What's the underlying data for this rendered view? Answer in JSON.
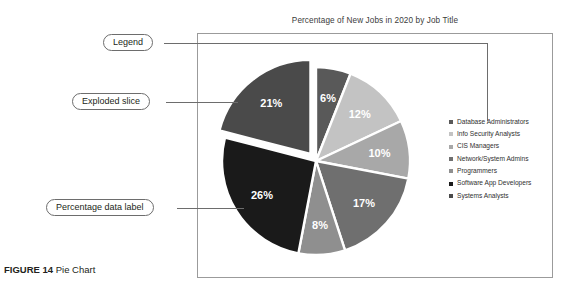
{
  "figure": {
    "caption_label": "FIGURE 14",
    "caption_text": "Pie Chart"
  },
  "callouts": {
    "legend": "Legend",
    "exploded": "Exploded slice",
    "data_label": "Percentage data label"
  },
  "chart_data": {
    "type": "pie",
    "title": "Percentage of New Jobs in 2020 by Job Title",
    "xlabel": "",
    "ylabel": "",
    "legend_position": "right",
    "grid": false,
    "units": "percent",
    "start_angle_deg": 0,
    "direction": "clockwise",
    "exploded_slice": "Systems Analysts",
    "categories": [
      "Database Administrators",
      "Info Security Analysts",
      "CIS Managers",
      "Network/System Admins",
      "Programmers",
      "Software App Developers",
      "Systems Analysts"
    ],
    "values": [
      6,
      12,
      10,
      17,
      8,
      26,
      21
    ],
    "labels": [
      "6%",
      "12%",
      "10%",
      "17%",
      "8%",
      "26%",
      "21%"
    ],
    "colors": [
      "#595959",
      "#c3c3c3",
      "#a8a8a8",
      "#6f6f6f",
      "#8f8f8f",
      "#1a1a1a",
      "#4a4a4a"
    ],
    "label_colors": [
      "#ffffff",
      "#3a3a3a",
      "#3a3a3a",
      "#ffffff",
      "#ffffff",
      "#ffffff",
      "#ffffff"
    ]
  }
}
